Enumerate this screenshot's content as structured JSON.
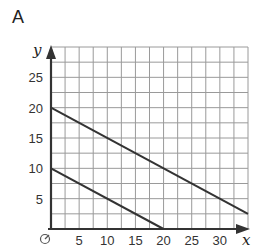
{
  "panel_label": "A",
  "chart_data": {
    "type": "line",
    "title": "",
    "xlabel": "x",
    "ylabel": "y",
    "origin_label": "O",
    "xlim": [
      0,
      35
    ],
    "ylim": [
      0,
      30
    ],
    "grid": true,
    "grid_step": 2.5,
    "x_ticks": [
      5,
      10,
      15,
      20,
      25,
      30
    ],
    "y_ticks": [
      5,
      10,
      15,
      20,
      25
    ],
    "series": [
      {
        "name": "upper line",
        "x": [
          0,
          35
        ],
        "y": [
          20,
          2.5
        ]
      },
      {
        "name": "lower line",
        "x": [
          0,
          20
        ],
        "y": [
          10,
          0
        ]
      }
    ]
  },
  "colors": {
    "grid": "#9a9a9a",
    "axis": "#333333",
    "line": "#333333"
  }
}
